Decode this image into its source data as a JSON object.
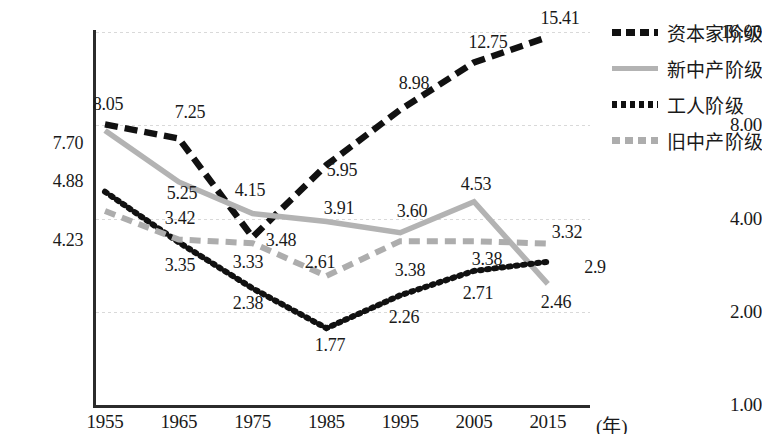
{
  "chart_data": {
    "type": "line",
    "title": "",
    "xlabel": "(年)",
    "ylabel": "",
    "x_scale": "linear",
    "y_scale": "log2",
    "grid": true,
    "legend_position": "right",
    "categories": [
      "1955",
      "1965",
      "1975",
      "1985",
      "1995",
      "2005",
      "2015"
    ],
    "y_ticks": [
      "1.00",
      "2.00",
      "4.00",
      "8.00",
      "16.00"
    ],
    "y_tick_values": [
      1,
      2,
      4,
      8,
      16
    ],
    "ylim": [
      1,
      16
    ],
    "series": [
      {
        "name": "资本家阶级",
        "style": "dashed",
        "color": "#111111",
        "values": [
          8.05,
          7.25,
          3.48,
          5.95,
          8.98,
          12.75,
          15.41
        ],
        "labels": [
          "8.05",
          "7.25",
          "3.48",
          "5.95",
          "8.98",
          "12.75",
          "15.41"
        ]
      },
      {
        "name": "新中产阶级",
        "style": "solid",
        "color": "#b3b3b3",
        "values": [
          7.7,
          5.25,
          4.15,
          3.91,
          3.6,
          4.53,
          2.46
        ],
        "labels": [
          "7.70",
          "5.25",
          "4.15",
          "3.91",
          "3.60",
          "4.53",
          "2.46"
        ]
      },
      {
        "name": "工人阶级",
        "style": "dotted",
        "color": "#111111",
        "values": [
          4.88,
          3.35,
          2.38,
          1.77,
          2.26,
          2.71,
          2.9
        ],
        "labels": [
          "4.88",
          "3.35",
          "2.38",
          "1.77",
          "2.26",
          "2.71",
          "2.9"
        ]
      },
      {
        "name": "旧中产阶级",
        "style": "dashed",
        "color": "#adadad",
        "values": [
          4.23,
          3.42,
          3.33,
          2.61,
          3.38,
          3.38,
          3.32
        ],
        "labels": [
          "4.23",
          "3.42",
          "3.33",
          "2.61",
          "3.38",
          "3.38",
          "3.32"
        ]
      }
    ],
    "label_positions": [
      {
        "text": "8.05",
        "x": 108,
        "y": 104
      },
      {
        "text": "7.25",
        "x": 190,
        "y": 112
      },
      {
        "text": "3.48",
        "x": 281,
        "y": 240
      },
      {
        "text": "5.95",
        "x": 342,
        "y": 170
      },
      {
        "text": "8.98",
        "x": 414,
        "y": 83
      },
      {
        "text": "12.75",
        "x": 488,
        "y": 42
      },
      {
        "text": "15.41",
        "x": 560,
        "y": 18
      },
      {
        "text": "7.70",
        "x": 68,
        "y": 143
      },
      {
        "text": "5.25",
        "x": 182,
        "y": 193
      },
      {
        "text": "4.15",
        "x": 250,
        "y": 190
      },
      {
        "text": "3.91",
        "x": 339,
        "y": 208
      },
      {
        "text": "3.60",
        "x": 412,
        "y": 211
      },
      {
        "text": "4.53",
        "x": 476,
        "y": 184
      },
      {
        "text": "2.46",
        "x": 556,
        "y": 302
      },
      {
        "text": "4.88",
        "x": 68,
        "y": 181
      },
      {
        "text": "3.35",
        "x": 180,
        "y": 265
      },
      {
        "text": "2.38",
        "x": 248,
        "y": 303
      },
      {
        "text": "1.77",
        "x": 330,
        "y": 345
      },
      {
        "text": "2.26",
        "x": 404,
        "y": 317
      },
      {
        "text": "2.71",
        "x": 478,
        "y": 293
      },
      {
        "text": "2.9",
        "x": 595,
        "y": 267
      },
      {
        "text": "4.23",
        "x": 68,
        "y": 240
      },
      {
        "text": "3.42",
        "x": 180,
        "y": 218
      },
      {
        "text": "3.33",
        "x": 248,
        "y": 262
      },
      {
        "text": "2.61",
        "x": 320,
        "y": 262
      },
      {
        "text": "3.38",
        "x": 410,
        "y": 270
      },
      {
        "text": "3.38",
        "x": 487,
        "y": 259
      },
      {
        "text": "3.32",
        "x": 567,
        "y": 232
      }
    ]
  },
  "legend": {
    "items": [
      {
        "label": "资本家阶级",
        "swatch": "legend-swatch-capitalist"
      },
      {
        "label": "新中产阶级",
        "swatch": "legend-swatch-new-middle"
      },
      {
        "label": "工人阶级",
        "swatch": "legend-swatch-working"
      },
      {
        "label": "旧中产阶级",
        "swatch": "legend-swatch-old-middle"
      }
    ]
  }
}
